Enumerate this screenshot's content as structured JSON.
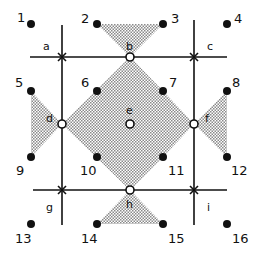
{
  "diagram": {
    "colors": {
      "ink": "#111111",
      "shade": "#c8c8c8",
      "background": "#ffffff"
    },
    "grid_lines": {
      "vertical_x": [
        62,
        194
      ],
      "horizontal_y": [
        57,
        190
      ]
    },
    "crossings": [
      {
        "id": "a",
        "x": 62,
        "y": 57,
        "label": "a",
        "lx": 42,
        "ly": 48
      },
      {
        "id": "c",
        "x": 194,
        "y": 57,
        "label": "c",
        "lx": 209,
        "ly": 48
      },
      {
        "id": "g",
        "x": 62,
        "y": 190,
        "label": "g",
        "lx": 46,
        "ly": 211
      },
      {
        "id": "i",
        "x": 194,
        "y": 190,
        "label": "i",
        "lx": 207,
        "ly": 211
      }
    ],
    "open_nodes": [
      {
        "id": "b",
        "x": 130,
        "y": 57,
        "label": "b"
      },
      {
        "id": "d",
        "x": 62,
        "y": 124,
        "label": "d"
      },
      {
        "id": "e",
        "x": 130,
        "y": 124,
        "label": "e"
      },
      {
        "id": "f",
        "x": 194,
        "y": 124,
        "label": "f"
      },
      {
        "id": "h",
        "x": 130,
        "y": 190,
        "label": "h"
      }
    ],
    "points": [
      {
        "n": "1",
        "x": 31,
        "y": 24
      },
      {
        "n": "2",
        "x": 97,
        "y": 24
      },
      {
        "n": "3",
        "x": 163,
        "y": 24
      },
      {
        "n": "4",
        "x": 227,
        "y": 24
      },
      {
        "n": "5",
        "x": 31,
        "y": 91
      },
      {
        "n": "6",
        "x": 97,
        "y": 91
      },
      {
        "n": "7",
        "x": 163,
        "y": 91
      },
      {
        "n": "8",
        "x": 227,
        "y": 91
      },
      {
        "n": "9",
        "x": 31,
        "y": 157
      },
      {
        "n": "10",
        "x": 97,
        "y": 157
      },
      {
        "n": "11",
        "x": 163,
        "y": 157
      },
      {
        "n": "12",
        "x": 227,
        "y": 157
      },
      {
        "n": "13",
        "x": 31,
        "y": 224
      },
      {
        "n": "14",
        "x": 97,
        "y": 224
      },
      {
        "n": "15",
        "x": 163,
        "y": 224
      },
      {
        "n": "16",
        "x": 227,
        "y": 224
      }
    ],
    "point_labels": {
      "1": "1",
      "2": "2",
      "3": "3",
      "4": "4",
      "5": "5",
      "6": "6",
      "7": "7",
      "8": "8",
      "9": "9",
      "10": "10",
      "11": "11",
      "12": "12",
      "13": "13",
      "14": "14",
      "15": "15",
      "16": "16"
    },
    "node_labels": {
      "a": "a",
      "b": "b",
      "c": "c",
      "d": "d",
      "e": "e",
      "f": "f",
      "g": "g",
      "h": "h",
      "i": "i"
    }
  }
}
